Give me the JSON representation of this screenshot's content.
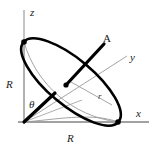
{
  "figure": {
    "canvas": {
      "width": 157,
      "height": 156,
      "background": "#ffffff"
    },
    "colors": {
      "axis": "#8a8a8a",
      "outline_thin": "#9a9a9a",
      "disk_edge": "#000000",
      "vector": "#000000",
      "label": "#1a1a1a",
      "r_label": "#3a3a3a"
    },
    "axes": [
      {
        "name": "z",
        "label": "z",
        "label_x": 30,
        "label_y": 8,
        "style": "italic"
      },
      {
        "name": "y",
        "label": "y",
        "label_x": 130,
        "label_y": 53,
        "style": "italic"
      },
      {
        "name": "x",
        "label": "x",
        "label_x": 136,
        "label_y": 109,
        "style": "italic"
      }
    ],
    "vectors": [
      {
        "name": "A",
        "label": "A",
        "label_x": 104,
        "label_y": 35,
        "style": "upright"
      }
    ],
    "lengths": [
      {
        "name": "R-vertical",
        "label": "R",
        "label_x": 7,
        "label_y": 80
      },
      {
        "name": "R-horizontal",
        "label": "R",
        "label_x": 68,
        "label_y": 134
      },
      {
        "name": "r-radius",
        "label": "r",
        "label_x": 98,
        "label_y": 93
      }
    ],
    "angles": [
      {
        "name": "theta",
        "label": "θ",
        "label_x": 30,
        "label_y": 100
      }
    ],
    "geometry": {
      "origin": {
        "x": 24,
        "y": 122
      },
      "z_axis_end": {
        "x": 24,
        "y": 10
      },
      "x_axis_end": {
        "x": 149,
        "y": 122
      },
      "y_axis_end": {
        "x": 127,
        "y": 56
      },
      "disk_vertex_top": {
        "x": 24,
        "y": 42
      },
      "disk_vertex_bottom": {
        "x": 118,
        "y": 122
      },
      "disk_center": {
        "x": 71,
        "y": 82
      },
      "disk_semi_major": 62,
      "disk_semi_minor": 23,
      "disk_rotation_deg": 40,
      "vector_A_start": {
        "x": 66,
        "y": 85
      },
      "vector_A_end": {
        "x": 104,
        "y": 44
      },
      "theta_line_end": {
        "x": 55,
        "y": 93
      }
    }
  }
}
